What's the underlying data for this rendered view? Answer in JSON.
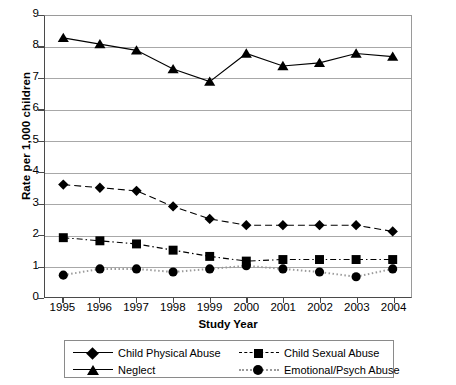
{
  "chart_data": {
    "type": "line",
    "title": "",
    "xlabel": "Study Year",
    "ylabel": "Rate per 1,000 children",
    "categories": [
      "1995",
      "1996",
      "1997",
      "1998",
      "1999",
      "2000",
      "2001",
      "2002",
      "2003",
      "2004"
    ],
    "x": [
      1995,
      1996,
      1997,
      1998,
      1999,
      2000,
      2001,
      2002,
      2003,
      2004
    ],
    "ylim": [
      0,
      9
    ],
    "yticks": [
      "0",
      "1",
      "2",
      "3",
      "4",
      "5",
      "6",
      "7",
      "8",
      "9"
    ],
    "grid": true,
    "legend_position": "bottom",
    "series": [
      {
        "name": "Child Physical Abuse",
        "marker": "diamond",
        "linestyle": "dashed",
        "color": "#000000",
        "values": [
          3.6,
          3.5,
          3.4,
          2.9,
          2.5,
          2.3,
          2.3,
          2.3,
          2.3,
          2.1
        ]
      },
      {
        "name": "Neglect",
        "marker": "triangle",
        "linestyle": "solid",
        "color": "#000000",
        "values": [
          8.3,
          8.1,
          7.9,
          7.3,
          6.9,
          7.8,
          7.4,
          7.5,
          7.8,
          7.7
        ]
      },
      {
        "name": "Child Sexual Abuse",
        "marker": "square",
        "linestyle": "dashdot",
        "color": "#000000",
        "values": [
          1.9,
          1.8,
          1.7,
          1.5,
          1.3,
          1.15,
          1.2,
          1.2,
          1.2,
          1.2
        ]
      },
      {
        "name": "Emotional/Psych Abuse",
        "marker": "circle",
        "linestyle": "dotted",
        "color": "#9a9a9a",
        "values": [
          0.7,
          0.9,
          0.9,
          0.8,
          0.9,
          1.0,
          0.9,
          0.8,
          0.65,
          0.9
        ]
      }
    ]
  },
  "legend": {
    "entries": [
      {
        "label": "Child Physical Abuse"
      },
      {
        "label": "Neglect"
      },
      {
        "label": "Child Sexual Abuse"
      },
      {
        "label": "Emotional/Psych Abuse"
      }
    ]
  }
}
